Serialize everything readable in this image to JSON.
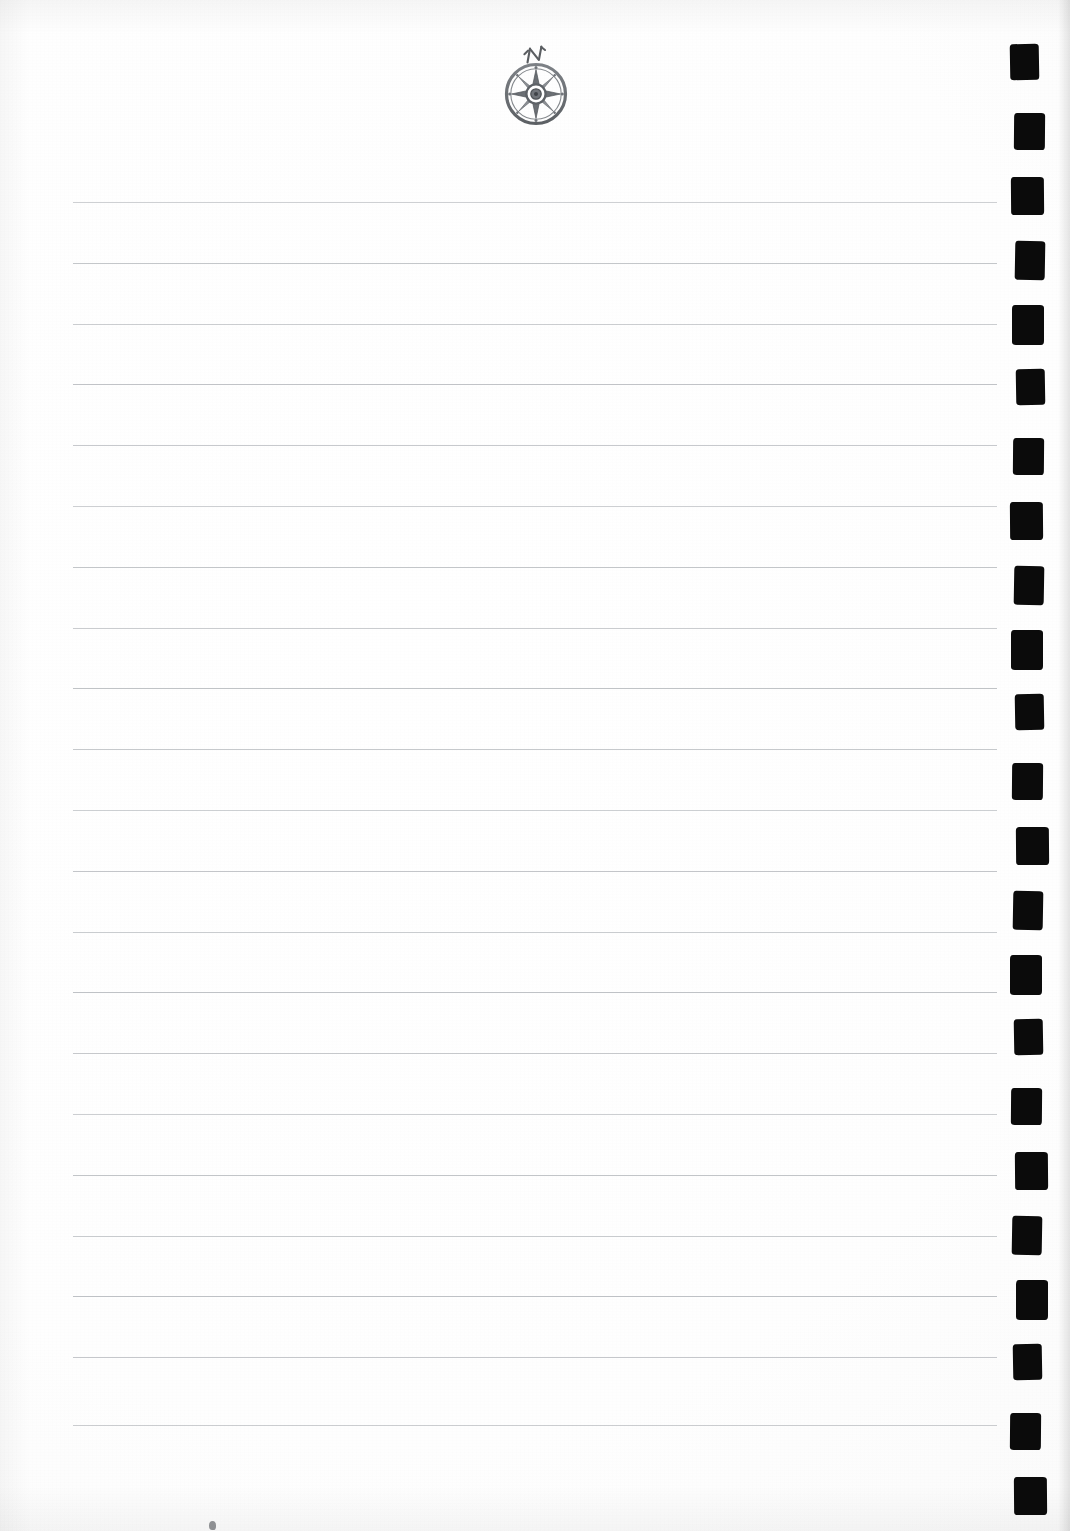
{
  "document": {
    "type": "scanned-ruled-journal-page",
    "title": "Blank Ruled Notebook Page",
    "page_width": 1070,
    "page_height": 1531,
    "background_color": "#ffffff",
    "written_content": "",
    "body_text": ""
  },
  "ornament": {
    "name": "compass-rose",
    "label": "N",
    "description": "Eight-point compass rose medallion with outer ring and central hub, hand-lettered N above",
    "color": "#6e7276",
    "ink_color": "#55585c",
    "center_x": 536,
    "center_y": 92,
    "diameter": 60
  },
  "ruled_lines": {
    "count": 21,
    "color": "#b9bcc0",
    "thickness_px": 1,
    "left_x": 73,
    "right_x": 997,
    "first_y": 202,
    "spacing_px": 61,
    "y_positions": [
      202,
      263,
      324,
      384,
      445,
      506,
      567,
      628,
      688,
      749,
      810,
      871,
      932,
      992,
      1053,
      1114,
      1175,
      1236,
      1296,
      1357,
      1425
    ]
  },
  "binding_marks": {
    "name": "registration-marks",
    "count": 23,
    "color": "#0b0b0b",
    "left_x": 1013,
    "width_px": 31,
    "height_px": 38,
    "first_y": 46,
    "spacing_px": 65,
    "description": "Hand-inked black square binding registration marks down the right margin"
  },
  "artifacts": {
    "speck": {
      "x": 209,
      "y": 1521
    }
  }
}
